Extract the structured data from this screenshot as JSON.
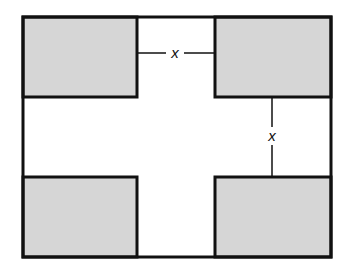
{
  "diagram": {
    "colors": {
      "stroke": "#111111",
      "shade": "#d6d6d6",
      "background": "#ffffff"
    },
    "labels": {
      "top_gap": "x",
      "right_gap": "x"
    },
    "corner_squares": [
      "top-left",
      "top-right",
      "bottom-left",
      "bottom-right"
    ]
  }
}
